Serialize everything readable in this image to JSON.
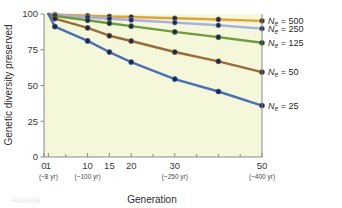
{
  "chart_data": {
    "type": "line",
    "title": "",
    "subtitle": "",
    "xlabel": "Generation",
    "ylabel": "Genetic diversity preserved",
    "xlim": [
      0,
      50
    ],
    "ylim": [
      0,
      100
    ],
    "grid": false,
    "plot_background": "#f4f7da",
    "legend_position": "right-outside",
    "x": [
      1,
      2.5,
      10,
      15,
      20,
      30,
      40,
      50
    ],
    "xticks": [
      {
        "value": 0,
        "label": "0",
        "sublabel": ""
      },
      {
        "value": 1,
        "label": "1",
        "sublabel": "(~8 yr)"
      },
      {
        "value": 10,
        "label": "10",
        "sublabel": "(~100 yr)"
      },
      {
        "value": 15,
        "label": "15",
        "sublabel": ""
      },
      {
        "value": 20,
        "label": "20",
        "sublabel": ""
      },
      {
        "value": 30,
        "label": "30",
        "sublabel": "(~250 yr)"
      },
      {
        "value": 50,
        "label": "50",
        "sublabel": "(~400 yr)"
      }
    ],
    "xminorticks": [
      5,
      25,
      35,
      40,
      45
    ],
    "yticks": [
      0,
      25,
      50,
      75,
      100
    ],
    "series": [
      {
        "name": "Ne = 500",
        "label_n": "N",
        "label_sub": "e",
        "label_rest": " = 500",
        "color": "#e0a33c",
        "values": [
          100,
          99.6,
          98.8,
          98.3,
          97.9,
          97.0,
          96.2,
          95.2
        ]
      },
      {
        "name": "Ne = 250",
        "label_n": "N",
        "label_sub": "e",
        "label_rest": " = 250",
        "color": "#a8aee0",
        "values": [
          100,
          99.3,
          97.7,
          96.7,
          95.8,
          94.0,
          92.1,
          89.8
        ]
      },
      {
        "name": "Ne = 125",
        "label_n": "N",
        "label_sub": "e",
        "label_rest": " = 125",
        "color": "#6f9a3f",
        "values": [
          100,
          98.6,
          95.6,
          93.5,
          91.5,
          87.5,
          83.8,
          79.9
        ]
      },
      {
        "name": "Ne = 50",
        "label_n": "N",
        "label_sub": "e",
        "label_rest": " = 50",
        "color": "#9a6b38",
        "values": [
          100,
          96.8,
          90.3,
          84.8,
          81.1,
          73.4,
          66.9,
          59.4
        ]
      },
      {
        "name": "Ne = 25",
        "label_n": "N",
        "label_sub": "e",
        "label_rest": " = 25",
        "color": "#4a6fb5",
        "values": [
          100,
          91.2,
          81.2,
          73.4,
          66.4,
          54.5,
          45.8,
          36.0
        ]
      }
    ],
    "marker": {
      "shape": "circle",
      "radius": 2.6,
      "edge_color": "#1b2a4a"
    }
  },
  "caption": {
    "ghost_text": "FIGURE"
  }
}
